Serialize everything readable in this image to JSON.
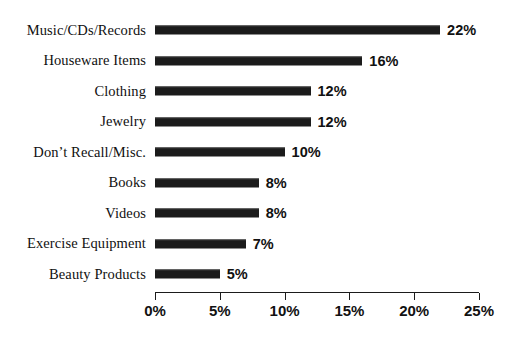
{
  "chart_data": {
    "type": "bar",
    "orientation": "horizontal",
    "title": "",
    "subtitle": "",
    "xlabel": "",
    "ylabel": "",
    "categories": [
      "Music/CDs/Records",
      "Houseware Items",
      "Clothing",
      "Jewelry",
      "Don’t Recall/Misc.",
      "Books",
      "Videos",
      "Exercise Equipment",
      "Beauty Products"
    ],
    "values": [
      22,
      16,
      12,
      12,
      10,
      8,
      8,
      7,
      5
    ],
    "value_labels": [
      "22%",
      "16%",
      "12%",
      "12%",
      "10%",
      "8%",
      "8%",
      "7%",
      "5%"
    ],
    "xlim": [
      0,
      25
    ],
    "xticks": [
      0,
      5,
      10,
      15,
      20,
      25
    ],
    "xtick_labels": [
      "0%",
      "5%",
      "10%",
      "15%",
      "20%",
      "25%"
    ],
    "grid": false,
    "legend": false,
    "bar_color": "#1b1b1b",
    "background_color": "#ffffff",
    "axis_color": "#1b1b1b"
  }
}
